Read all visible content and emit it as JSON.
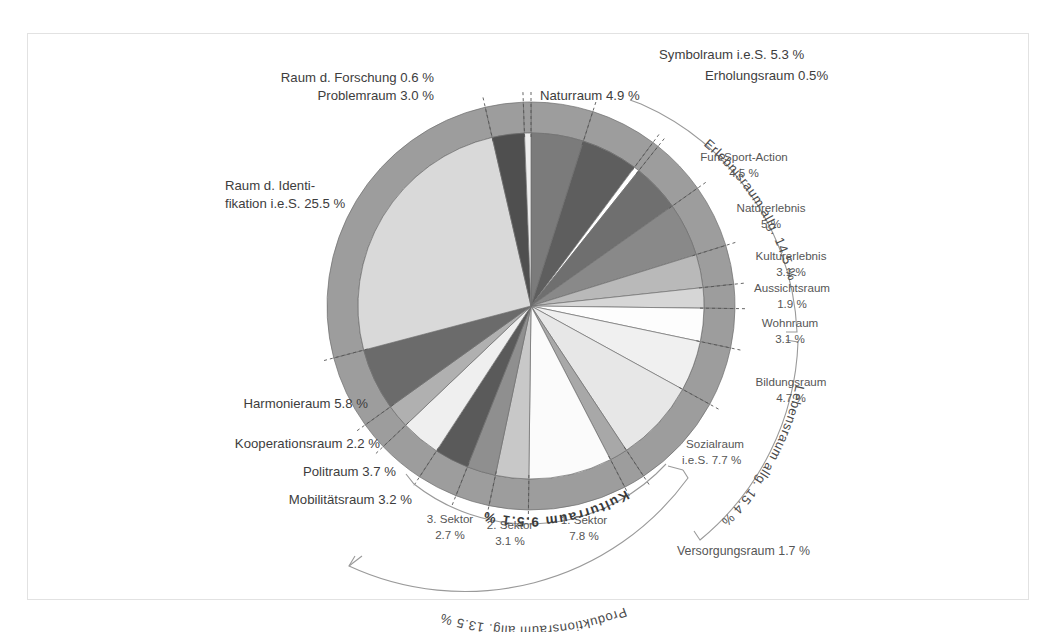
{
  "figure": {
    "background": "#ffffff",
    "frame_color": "#e2e2e2",
    "center": {
      "x": 531,
      "y": 306
    },
    "inner_radius": 173,
    "ring_outer_radius": 204,
    "ring_color": "#9d9d9d",
    "start_angle_deg": -90
  },
  "chart_data": {
    "type": "pie",
    "title": "",
    "units": "%",
    "note": "Doughnut/pie of spatial function types (German). Inner pie = individual sectors; outer grey ring = same segmentation; curved outer brackets = grouped aggregates.",
    "categories": [
      "Naturraum",
      "Symbolraum i.e.S.",
      "Erholungsraum",
      "Fun-Sport-Action",
      "Naturerlebnis",
      "Kulturerlebnis",
      "Aussichtsraum",
      "Wohnraum",
      "Bildungsraum",
      "Sozialraum i.e.S.",
      "Versorgungsraum",
      "1. Sektor",
      "2. Sektor",
      "3. Sektor",
      "Mobilitätsraum",
      "Politraum",
      "Kooperationsraum",
      "Harmonieraum",
      "Raum d. Identifikation i.e.S.",
      "Problemraum",
      "Raum d. Forschung"
    ],
    "values": [
      4.9,
      5.3,
      0.5,
      4.5,
      5.0,
      3.1,
      1.9,
      3.1,
      4.7,
      7.7,
      1.7,
      7.8,
      3.1,
      2.7,
      3.2,
      3.7,
      2.2,
      5.8,
      25.5,
      3.0,
      0.6
    ],
    "slice_colors": [
      "#7b7b7b",
      "#5e5e5e",
      "#ffffff",
      "#6f6f6f",
      "#898989",
      "#b9b9b9",
      "#d6d6d6",
      "#fdfdfd",
      "#f0f0f0",
      "#e7e7e7",
      "#a8a8a8",
      "#fbfbfb",
      "#c8c8c8",
      "#8f8f8f",
      "#5a5a5a",
      "#efefef",
      "#b0b0b0",
      "#6b6b6b",
      "#d9d9d9",
      "#4f4f4f",
      "#ededed"
    ],
    "groups": [
      {
        "label": "Erlebnisraum allg.",
        "value": 14.5,
        "members": [
          "Fun-Sport-Action",
          "Naturerlebnis",
          "Kulturerlebnis",
          "Aussichtsraum"
        ]
      },
      {
        "label": "Lebensraum allg.",
        "value": 15.4,
        "members": [
          "Wohnraum",
          "Bildungsraum",
          "Sozialraum i.e.S."
        ]
      },
      {
        "label": "Produktionsraum allg.",
        "value": 13.5,
        "members": [
          "1. Sektor",
          "2. Sektor",
          "3. Sektor",
          "Versorgungsraum"
        ]
      },
      {
        "label": "Kulturraum",
        "value": 15.9,
        "members": [
          "1. Sektor",
          "2. Sektor",
          "3. Sektor"
        ]
      }
    ],
    "legend_position": "callout-labels"
  },
  "labels": {
    "raum_forschung": "Raum d. Forschung 0.6 %",
    "problemraum": "Problemraum 3.0 %",
    "naturraum": "Naturraum 4.9 %",
    "symbolraum": "Symbolraum i.e.S. 5.3 %",
    "erholungsraum": "Erholungsraum 0.5%",
    "fun_sport_action_name": "Fun-Sport-Action",
    "fun_sport_action_val": "4.5 %",
    "naturerlebnis_name": "Naturerlebnis",
    "naturerlebnis_val": "5 %",
    "kulturerlebnis_name": "Kulturerlebnis",
    "kulturerlebnis_val": "3.1 %",
    "aussichtsraum_name": "Aussichtsraum",
    "aussichtsraum_val": "1.9 %",
    "wohnraum_name": "Wohnraum",
    "wohnraum_val": "3.1 %",
    "bildungsraum_name": "Bildungsraum",
    "bildungsraum_val": "4.7 %",
    "sozialraum_name": "Sozialraum",
    "sozialraum_val": "i.e.S.  7.7 %",
    "versorgungsraum": "Versorgungsraum 1.7 %",
    "sektor1_name": "1. Sektor",
    "sektor1_val": "7.8 %",
    "sektor2_name": "2. Sektor",
    "sektor2_val": "3.1 %",
    "sektor3_name": "3. Sektor",
    "sektor3_val": "2.7 %",
    "mobilitaetsraum": "Mobilitätsraum 3.2 %",
    "politraum": "Politraum 3.7 %",
    "kooperationsraum": "Kooperationsraum 2.2 %",
    "harmonieraum": "Harmonieraum 5.8 %",
    "identifikation_l1": "Raum d. Identi-",
    "identifikation_l2": "fikation i.e.S. 25.5 %",
    "group_erlebnisraum": "Erlebnisraum allg. 14.5 %",
    "group_lebensraum": "Lebensraum allg. 15.4 %",
    "group_produktionsraum": "Produktionsraum allg. 13.5 %",
    "group_kulturraum": "Kulturraum 9.5.1 %"
  }
}
